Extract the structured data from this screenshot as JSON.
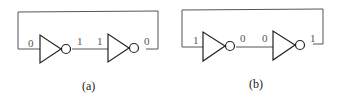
{
  "diagrams": [
    {
      "caption": "(a)",
      "inverter1": {
        "input": "0",
        "output": "1"
      },
      "inverter2": {
        "input": "1",
        "output": "0"
      }
    },
    {
      "caption": "(b)",
      "inverter1": {
        "input": "1",
        "output": "0"
      },
      "inverter2": {
        "input": "0",
        "output": "1"
      }
    }
  ]
}
